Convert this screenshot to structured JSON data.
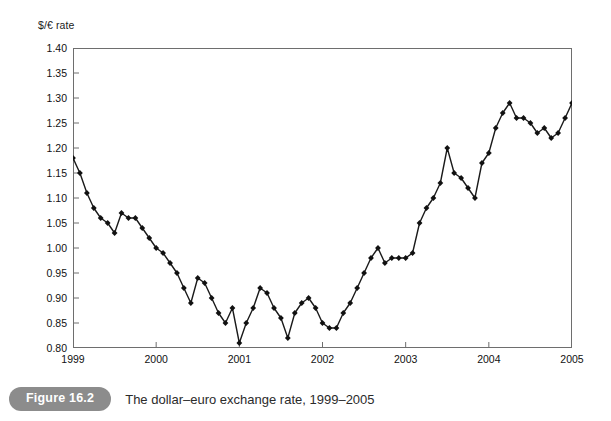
{
  "figure": {
    "badge": "Figure 16.2",
    "caption": "The dollar–euro exchange rate, 1999–2005"
  },
  "colors": {
    "line": "#1a1a1a",
    "marker": "#111111",
    "axis": "#6e6e6e",
    "badge_bg": "#8c8c8c",
    "background": "#ffffff"
  },
  "chart_data": {
    "type": "line",
    "title": "",
    "subtitle": "",
    "xlabel": "",
    "ylabel": "$/€ rate",
    "ylim": [
      0.8,
      1.4
    ],
    "xlim": [
      1999.0,
      2005.0
    ],
    "ytick_step": 0.05,
    "grid": false,
    "legend": null,
    "markers": "diamond",
    "ytick_labels": [
      "1.40",
      "1.35",
      "1.30",
      "1.25",
      "1.20",
      "1.15",
      "1.10",
      "1.05",
      "1.00",
      "0.95",
      "0.90",
      "0.85",
      "0.80"
    ],
    "ytick_values": [
      1.4,
      1.35,
      1.3,
      1.25,
      1.2,
      1.15,
      1.1,
      1.05,
      1.0,
      0.95,
      0.9,
      0.85,
      0.8
    ],
    "xtick_labels": [
      "1999",
      "2000",
      "2001",
      "2002",
      "2003",
      "2004",
      "2005"
    ],
    "xtick_values": [
      1999,
      2000,
      2001,
      2002,
      2003,
      2004,
      2005
    ],
    "series": [
      {
        "name": "$/€ rate",
        "x": [
          1999.0,
          1999.083,
          1999.167,
          1999.25,
          1999.333,
          1999.417,
          1999.5,
          1999.583,
          1999.667,
          1999.75,
          1999.833,
          1999.917,
          2000.0,
          2000.083,
          2000.167,
          2000.25,
          2000.333,
          2000.417,
          2000.5,
          2000.583,
          2000.667,
          2000.75,
          2000.833,
          2000.917,
          2001.0,
          2001.083,
          2001.167,
          2001.25,
          2001.333,
          2001.417,
          2001.5,
          2001.583,
          2001.667,
          2001.75,
          2001.833,
          2001.917,
          2002.0,
          2002.083,
          2002.167,
          2002.25,
          2002.333,
          2002.417,
          2002.5,
          2002.583,
          2002.667,
          2002.75,
          2002.833,
          2002.917,
          2003.0,
          2003.083,
          2003.167,
          2003.25,
          2003.333,
          2003.417,
          2003.5,
          2003.583,
          2003.667,
          2003.75,
          2003.833,
          2003.917,
          2004.0,
          2004.083,
          2004.167,
          2004.25,
          2004.333,
          2004.417,
          2004.5,
          2004.583,
          2004.667,
          2004.75,
          2004.833,
          2004.917,
          2005.0
        ],
        "values": [
          1.18,
          1.15,
          1.11,
          1.08,
          1.06,
          1.05,
          1.03,
          1.07,
          1.06,
          1.06,
          1.04,
          1.02,
          1.0,
          0.99,
          0.97,
          0.95,
          0.92,
          0.89,
          0.94,
          0.93,
          0.9,
          0.87,
          0.85,
          0.88,
          0.81,
          0.85,
          0.88,
          0.92,
          0.91,
          0.88,
          0.86,
          0.82,
          0.87,
          0.89,
          0.9,
          0.88,
          0.85,
          0.84,
          0.84,
          0.87,
          0.89,
          0.92,
          0.95,
          0.98,
          1.0,
          0.97,
          0.98,
          0.98,
          0.98,
          0.99,
          1.05,
          1.08,
          1.1,
          1.13,
          1.2,
          1.15,
          1.14,
          1.12,
          1.1,
          1.17,
          1.19,
          1.24,
          1.27,
          1.29,
          1.26,
          1.26,
          1.25,
          1.23,
          1.24,
          1.22,
          1.23,
          1.26,
          1.29
        ]
      }
    ]
  }
}
